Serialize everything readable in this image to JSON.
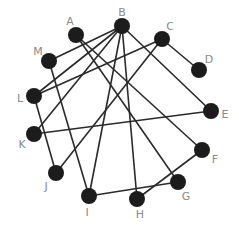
{
  "diagram": {
    "type": "graph",
    "node_color": "#1c1c1c",
    "edge_color": "#2a2a2a",
    "label_color": "#8a8a8a",
    "nodes": [
      {
        "id": "A",
        "x": 76,
        "y": 35,
        "lx": 70,
        "ly": 21
      },
      {
        "id": "B",
        "x": 122,
        "y": 26,
        "lx": 122,
        "ly": 12
      },
      {
        "id": "C",
        "x": 162,
        "y": 39,
        "lx": 170,
        "ly": 26
      },
      {
        "id": "D",
        "x": 199,
        "y": 70,
        "lx": 209,
        "ly": 59
      },
      {
        "id": "E",
        "x": 211,
        "y": 111,
        "lx": 225,
        "ly": 114
      },
      {
        "id": "F",
        "x": 202,
        "y": 150,
        "lx": 215,
        "ly": 159
      },
      {
        "id": "G",
        "x": 178,
        "y": 182,
        "lx": 186,
        "ly": 196
      },
      {
        "id": "H",
        "x": 137,
        "y": 199,
        "lx": 140,
        "ly": 214
      },
      {
        "id": "I",
        "x": 89,
        "y": 196,
        "lx": 87,
        "ly": 212
      },
      {
        "id": "J",
        "x": 56,
        "y": 173,
        "lx": 46,
        "ly": 186
      },
      {
        "id": "K",
        "x": 34,
        "y": 134,
        "lx": 22,
        "ly": 144
      },
      {
        "id": "L",
        "x": 34,
        "y": 96,
        "lx": 20,
        "ly": 98
      },
      {
        "id": "M",
        "x": 49,
        "y": 61,
        "lx": 38,
        "ly": 51
      }
    ],
    "edges": [
      [
        "A",
        "G"
      ],
      [
        "A",
        "F"
      ],
      [
        "M",
        "B"
      ],
      [
        "M",
        "I"
      ],
      [
        "B",
        "L"
      ],
      [
        "B",
        "K"
      ],
      [
        "B",
        "I"
      ],
      [
        "B",
        "H"
      ],
      [
        "B",
        "E"
      ],
      [
        "C",
        "D"
      ],
      [
        "C",
        "J"
      ],
      [
        "C",
        "L"
      ],
      [
        "L",
        "J"
      ],
      [
        "K",
        "E"
      ],
      [
        "I",
        "G"
      ],
      [
        "H",
        "F"
      ]
    ]
  }
}
